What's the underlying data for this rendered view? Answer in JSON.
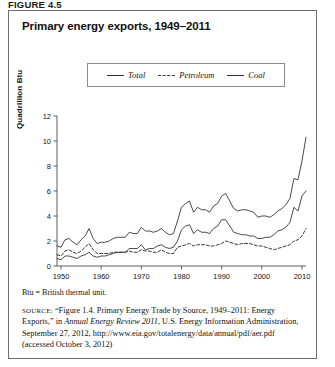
{
  "figure_label": "FIGURE 4.5",
  "panel": {
    "title": "Primary energy exports, 1949–2011",
    "note": "Btu = British thermal unit.",
    "source": {
      "tag": "SOURCE:",
      "part1": " “Figure 1.4. Primary Energy Trade by Source, 1949–2011: Energy Exports,” in ",
      "italic": "Annual Energy Review 2011",
      "part2": ", U.S. Energy Information Administration, September 27, 2012, http://www.eia.gov/totalenergy/data/annual/pdf/aer.pdf (accessed October 3, 2012)"
    }
  },
  "legend": {
    "items": [
      {
        "label": "Total",
        "style": "solid"
      },
      {
        "label": "Petroleum",
        "style": "dashed"
      },
      {
        "label": "Coal",
        "style": "solid"
      }
    ]
  },
  "chart_data": {
    "type": "line",
    "title": "Primary energy exports, 1949–2011",
    "xlabel": "",
    "ylabel": "Quadrillion Btu",
    "xlim": [
      1949,
      2011
    ],
    "ylim": [
      0,
      12
    ],
    "yticks": [
      0,
      2,
      4,
      6,
      8,
      10,
      12
    ],
    "xticks": [
      1950,
      1960,
      1970,
      1980,
      1990,
      2000,
      2010
    ],
    "grid": false,
    "legend_position": "top-center",
    "x": [
      1949,
      1950,
      1951,
      1952,
      1953,
      1954,
      1955,
      1956,
      1957,
      1958,
      1959,
      1960,
      1961,
      1962,
      1963,
      1964,
      1965,
      1966,
      1967,
      1968,
      1969,
      1970,
      1971,
      1972,
      1973,
      1974,
      1975,
      1976,
      1977,
      1978,
      1979,
      1980,
      1981,
      1982,
      1983,
      1984,
      1985,
      1986,
      1987,
      1988,
      1989,
      1990,
      1991,
      1992,
      1993,
      1994,
      1995,
      1996,
      1997,
      1998,
      1999,
      2000,
      2001,
      2002,
      2003,
      2004,
      2005,
      2006,
      2007,
      2008,
      2009,
      2010,
      2011
    ],
    "series": [
      {
        "name": "Total",
        "style": "solid",
        "values": [
          1.6,
          1.5,
          2.1,
          2.2,
          1.9,
          1.7,
          2.1,
          2.4,
          3.0,
          2.2,
          1.8,
          1.9,
          1.9,
          2.0,
          2.2,
          2.3,
          2.3,
          2.3,
          2.7,
          2.6,
          2.6,
          3.1,
          2.8,
          2.8,
          2.7,
          2.8,
          3.0,
          2.7,
          2.5,
          2.6,
          3.6,
          4.7,
          5.0,
          5.2,
          4.3,
          4.7,
          4.5,
          4.5,
          4.3,
          4.8,
          5.0,
          5.6,
          5.8,
          5.2,
          4.6,
          4.4,
          4.5,
          4.5,
          4.4,
          4.3,
          3.9,
          4.0,
          4.0,
          3.9,
          4.1,
          4.4,
          4.6,
          4.9,
          5.4,
          7.0,
          6.9,
          8.4,
          10.3
        ]
      },
      {
        "name": "Petroleum",
        "style": "dashed",
        "values": [
          0.9,
          0.8,
          1.2,
          1.3,
          1.1,
          1.0,
          1.2,
          1.5,
          1.8,
          1.3,
          1.0,
          1.0,
          1.0,
          1.0,
          1.1,
          1.1,
          1.1,
          1.1,
          1.2,
          1.1,
          1.1,
          1.3,
          1.2,
          1.2,
          1.1,
          1.1,
          1.3,
          1.1,
          1.0,
          1.0,
          1.5,
          1.6,
          1.7,
          1.8,
          1.6,
          1.7,
          1.7,
          1.7,
          1.6,
          1.6,
          1.7,
          1.8,
          2.0,
          1.9,
          1.8,
          1.7,
          1.8,
          1.8,
          1.8,
          1.7,
          1.6,
          1.6,
          1.5,
          1.4,
          1.3,
          1.4,
          1.5,
          1.6,
          1.7,
          2.0,
          2.1,
          2.4,
          3.0
        ]
      },
      {
        "name": "Coal",
        "style": "solid",
        "values": [
          0.6,
          0.5,
          0.8,
          0.8,
          0.7,
          0.6,
          0.8,
          0.9,
          1.1,
          0.8,
          0.7,
          0.8,
          0.8,
          0.9,
          1.0,
          1.1,
          1.1,
          1.1,
          1.4,
          1.4,
          1.4,
          1.7,
          1.3,
          1.4,
          1.4,
          1.6,
          1.7,
          1.5,
          1.4,
          1.5,
          2.0,
          2.9,
          3.2,
          3.3,
          2.6,
          2.9,
          2.7,
          2.7,
          2.6,
          3.0,
          3.2,
          3.7,
          3.7,
          3.2,
          2.7,
          2.6,
          2.5,
          2.5,
          2.4,
          2.4,
          2.2,
          2.2,
          2.3,
          2.3,
          2.5,
          2.8,
          2.9,
          3.1,
          3.5,
          4.7,
          4.4,
          5.6,
          6.0
        ]
      }
    ]
  }
}
